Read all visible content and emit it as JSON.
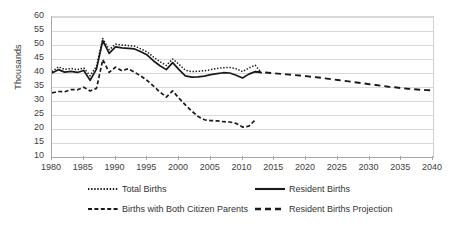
{
  "chart_data": {
    "type": "line",
    "title": "",
    "xlabel": "",
    "ylabel": "Thousands",
    "xlim": [
      1980,
      2040
    ],
    "ylim": [
      10,
      60
    ],
    "grid": true,
    "legend_position": "bottom",
    "x_ticks": [
      1980,
      1985,
      1990,
      1995,
      2000,
      2005,
      2010,
      2015,
      2020,
      2025,
      2030,
      2035,
      2040
    ],
    "y_ticks": [
      10,
      15,
      20,
      25,
      30,
      35,
      40,
      45,
      50,
      55,
      60
    ],
    "series": [
      {
        "name": "Total Births",
        "style": "dotted",
        "x": [
          1980,
          1981,
          1982,
          1983,
          1984,
          1985,
          1986,
          1987,
          1988,
          1989,
          1990,
          1991,
          1992,
          1993,
          1994,
          1995,
          1996,
          1997,
          1998,
          1999,
          2000,
          2001,
          2002,
          2003,
          2004,
          2005,
          2006,
          2007,
          2008,
          2009,
          2010,
          2011,
          2012,
          2013
        ],
        "values": [
          40.5,
          42.2,
          41.3,
          41.6,
          41.2,
          41.8,
          39.0,
          42.4,
          52.3,
          48.3,
          50.3,
          50.0,
          49.8,
          49.6,
          48.6,
          47.5,
          45.7,
          44.0,
          42.7,
          45.0,
          43.1,
          41.0,
          40.5,
          40.6,
          40.8,
          41.2,
          41.6,
          41.9,
          42.0,
          41.5,
          40.5,
          41.8,
          42.8,
          40.0
        ]
      },
      {
        "name": "Resident Births",
        "style": "solid",
        "x": [
          1980,
          1981,
          1982,
          1983,
          1984,
          1985,
          1986,
          1987,
          1988,
          1989,
          1990,
          1991,
          1992,
          1993,
          1994,
          1995,
          1996,
          1997,
          1998,
          1999,
          2000,
          2001,
          2002,
          2003,
          2004,
          2005,
          2006,
          2007,
          2008,
          2009,
          2010,
          2011,
          2012,
          2013
        ],
        "values": [
          40.0,
          41.2,
          40.3,
          40.6,
          40.2,
          40.9,
          37.4,
          41.4,
          51.6,
          47.0,
          49.3,
          49.0,
          48.8,
          48.6,
          47.6,
          46.4,
          44.3,
          42.6,
          41.2,
          43.7,
          41.2,
          39.0,
          38.5,
          38.6,
          38.9,
          39.4,
          39.8,
          40.1,
          40.0,
          39.2,
          38.2,
          39.6,
          40.5,
          40.1
        ]
      },
      {
        "name": "Births with Both Citizen Parents",
        "style": "dashed-fine",
        "x": [
          1980,
          1981,
          1982,
          1983,
          1984,
          1985,
          1986,
          1987,
          1988,
          1989,
          1990,
          1991,
          1992,
          1993,
          1994,
          1995,
          1996,
          1997,
          1998,
          1999,
          2000,
          2001,
          2002,
          2003,
          2004,
          2005,
          2006,
          2007,
          2008,
          2009,
          2010,
          2011,
          2012
        ],
        "values": [
          32.9,
          33.4,
          33.3,
          34.1,
          34.0,
          34.9,
          33.6,
          34.5,
          44.8,
          40.2,
          42.1,
          40.8,
          41.5,
          40.3,
          38.9,
          37.3,
          35.3,
          33.2,
          31.4,
          33.6,
          31.0,
          28.6,
          26.4,
          24.5,
          23.3,
          23.0,
          22.9,
          22.6,
          22.5,
          22.0,
          20.7,
          21.0,
          23.2
        ]
      },
      {
        "name": "Resident Births Projection",
        "style": "dashed-long",
        "x": [
          2012,
          2013,
          2014,
          2015,
          2016,
          2017,
          2018,
          2019,
          2020,
          2021,
          2022,
          2023,
          2024,
          2025,
          2026,
          2027,
          2028,
          2029,
          2030,
          2031,
          2032,
          2033,
          2034,
          2035,
          2036,
          2037,
          2038,
          2039,
          2040
        ],
        "values": [
          40.5,
          40.3,
          40.1,
          39.9,
          39.7,
          39.5,
          39.3,
          39.1,
          38.9,
          38.6,
          38.4,
          38.1,
          37.8,
          37.5,
          37.2,
          36.9,
          36.6,
          36.3,
          36.0,
          35.7,
          35.4,
          35.1,
          34.9,
          34.6,
          34.4,
          34.2,
          34.0,
          33.9,
          33.8
        ]
      }
    ]
  },
  "legend": {
    "items": [
      {
        "label": "Total Births",
        "style": "dotted"
      },
      {
        "label": "Resident Births",
        "style": "solid"
      },
      {
        "label": "Births with Both Citizen Parents",
        "style": "dashed-fine"
      },
      {
        "label": "Resident Births Projection",
        "style": "dashed-long"
      }
    ]
  },
  "colors": {
    "series": "#1a1a1a",
    "grid": "#d9d9d9",
    "axis": "#a8a8a8",
    "text": "#404040",
    "background": "#ffffff"
  }
}
